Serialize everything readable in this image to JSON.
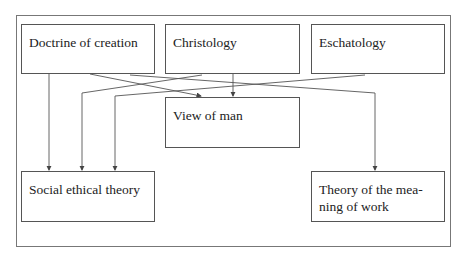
{
  "diagram": {
    "nodes": [
      {
        "id": "doctrine",
        "label": "Doctrine of creation"
      },
      {
        "id": "christology",
        "label": "Christology"
      },
      {
        "id": "eschatology",
        "label": "Eschatology"
      },
      {
        "id": "view_of_man",
        "label": "View of man"
      },
      {
        "id": "social",
        "label": "Social ethical theory"
      },
      {
        "id": "work",
        "label": "Theory of the mea-\nning of work"
      }
    ],
    "edges": [
      {
        "from": "doctrine",
        "to": "social"
      },
      {
        "from": "doctrine",
        "to": "view_of_man"
      },
      {
        "from": "doctrine",
        "to": "work"
      },
      {
        "from": "christology",
        "to": "view_of_man"
      },
      {
        "from": "christology",
        "to": "social"
      },
      {
        "from": "eschatology",
        "to": "social"
      },
      {
        "from": "eschatology",
        "to": "view_of_man"
      }
    ]
  },
  "labels": {
    "doctrine": "Doctrine of creation",
    "christology": "Christology",
    "eschatology": "Eschatology",
    "view_of_man": "View of man",
    "social": "Social ethical theory",
    "work_line1": "Theory of the mea-",
    "work_line2": "ning of work"
  }
}
